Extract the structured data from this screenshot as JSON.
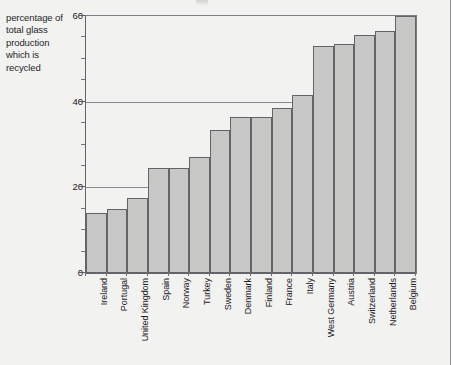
{
  "axis_caption": "percentage of total glass production which is recycled",
  "chart_data": {
    "type": "bar",
    "title": "",
    "xlabel": "",
    "ylabel": "percentage of total glass production which is recycled",
    "ylim": [
      0,
      60
    ],
    "yticks": [
      0,
      20,
      40,
      60
    ],
    "ytick_labels": [
      "0",
      "20",
      "40",
      "60"
    ],
    "yminor_step": 5,
    "grid": "horizontal",
    "legend": "none",
    "categories": [
      "Ireland",
      "Portugal",
      "United Kingdom",
      "Spain",
      "Norway",
      "Turkey",
      "Sweden",
      "Denmark",
      "Finland",
      "France",
      "Italy",
      "West Germany",
      "Austria",
      "Switzerland",
      "Netherlands",
      "Belgium"
    ],
    "values": [
      14,
      15,
      17.5,
      24.5,
      24.5,
      27,
      33.5,
      36.5,
      36.5,
      38.5,
      41.5,
      53,
      53.5,
      55.5,
      56.5,
      60
    ],
    "bar_fill_color": "#c7c7c5",
    "bar_edge_color": "#636469",
    "grid_color": "#8a8b90",
    "axis_color": "#63646a",
    "background_color": "#f2f2f0"
  }
}
